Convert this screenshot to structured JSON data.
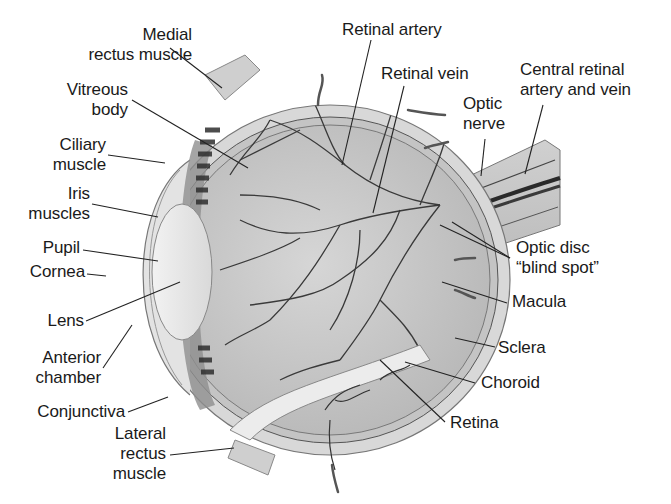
{
  "diagram": {
    "colors": {
      "background": "#ffffff",
      "text": "#1a1a1a",
      "leader_line": "#222222",
      "sclera": "#d4d4d4",
      "vitreous": "#c9c9c9",
      "vessel": "#3a3a3a"
    },
    "labels": {
      "medial_rectus_muscle": {
        "line1": "Medial",
        "line2": "rectus muscle"
      },
      "vitreous_body": {
        "line1": "Vitreous",
        "line2": "body"
      },
      "ciliary_muscle": {
        "line1": "Ciliary",
        "line2": "muscle"
      },
      "iris_muscles": {
        "line1": "Iris",
        "line2": "muscles"
      },
      "pupil": "Pupil",
      "cornea": "Cornea",
      "lens": "Lens",
      "anterior_chamber": {
        "line1": "Anterior",
        "line2": "chamber"
      },
      "conjunctiva": "Conjunctiva",
      "lateral_rectus_muscle": {
        "line1": "Lateral",
        "line2": "rectus",
        "line3": "muscle"
      },
      "retinal_artery": "Retinal artery",
      "retinal_vein": "Retinal vein",
      "central_retinal_artery_and_vein": {
        "line1": "Central retinal",
        "line2": "artery and vein"
      },
      "optic_nerve": {
        "line1": "Optic",
        "line2": "nerve"
      },
      "optic_disc": {
        "line1": "Optic disc",
        "line2": "“blind spot”"
      },
      "macula": "Macula",
      "sclera": "Sclera",
      "choroid": "Choroid",
      "retina": "Retina"
    }
  }
}
